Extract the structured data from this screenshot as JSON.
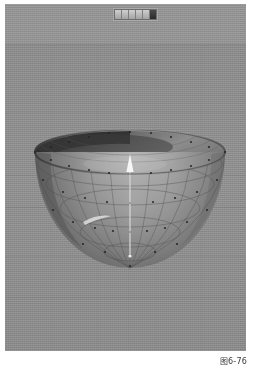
{
  "figure": {
    "caption": "图6-76",
    "domain_note": "3D modeling application viewport"
  },
  "viewport": {
    "name": "perspective-viewport",
    "background_color": "#8e8e8e",
    "sky_color": "#949494",
    "ground_color": "#8c8c8c",
    "horizon_y": 40,
    "grid_color": "#7f7f7f",
    "grid_rows_y": [
      108,
      171,
      203,
      252,
      293
    ],
    "grid_cols_x": [
      46,
      92,
      123,
      150,
      196
    ]
  },
  "toolbar": {
    "name": "viewport-toolbar",
    "buttons": [
      {
        "label": "",
        "state": "normal"
      },
      {
        "label": "",
        "state": "normal"
      },
      {
        "label": "",
        "state": "normal"
      },
      {
        "label": "",
        "state": "normal"
      },
      {
        "label": "",
        "state": "normal"
      },
      {
        "label": "",
        "state": "active"
      }
    ]
  },
  "model": {
    "name": "hemisphere-bowl",
    "type": "hemisphere",
    "shading": "smooth-gray",
    "wireframe": true,
    "rim_center_x": 125,
    "rim_center_y": 148,
    "rim_radius_x": 95,
    "rim_radius_y": 22,
    "bottom_y": 264,
    "surface_light_color": "#b2b2b2",
    "surface_dark_color": "#5a5a5a",
    "interior_color": "#3e3e3e",
    "wire_color": "#4a4a4a",
    "vertex_color": "#2a2a2a",
    "meridian_count": 13,
    "parallel_count": 5,
    "specular_highlight": true
  },
  "gizmo": {
    "name": "z-axis-gizmo",
    "color": "#f2f2f2",
    "origin_x": 125,
    "origin_y": 252,
    "tip_y": 152,
    "direction": "up"
  }
}
